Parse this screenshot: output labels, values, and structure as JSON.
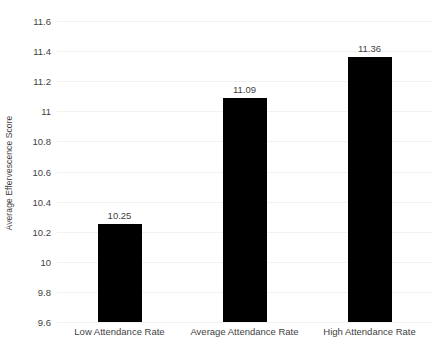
{
  "chart_data": {
    "type": "bar",
    "title": "",
    "subtitle": "",
    "xlabel": "",
    "ylabel": "Average Effervescence Score",
    "categories": [
      "Low Attendance Rate",
      "Average Attendance Rate",
      "High Attendance Rate"
    ],
    "values": [
      10.25,
      11.09,
      11.36
    ],
    "value_labels": [
      "10.25",
      "11.09",
      "11.36"
    ],
    "ylim": [
      9.6,
      11.6
    ],
    "ytick_step": 0.2,
    "ytick_labels": [
      "11.6",
      "11.4",
      "11.2",
      "11",
      "10.8",
      "10.6",
      "10.4",
      "10.2",
      "10",
      "9.8",
      "9.6"
    ],
    "ytick_values": [
      11.6,
      11.4,
      11.2,
      11.0,
      10.8,
      10.6,
      10.4,
      10.2,
      10.0,
      9.8,
      9.6
    ],
    "grid": {
      "horizontal": true,
      "vertical": false,
      "color": "#f1f1f1"
    },
    "legend": {
      "visible": false,
      "position": "none",
      "entries": []
    },
    "series": [
      {
        "name": "Average Effervescence Score",
        "color": "#000000",
        "values": [
          10.25,
          11.09,
          11.36
        ]
      }
    ],
    "annotations": [],
    "colors": {
      "bar": "#000000",
      "text": "#3f3f3f",
      "background": "#ffffff",
      "gridline": "#f1f1f1"
    }
  }
}
